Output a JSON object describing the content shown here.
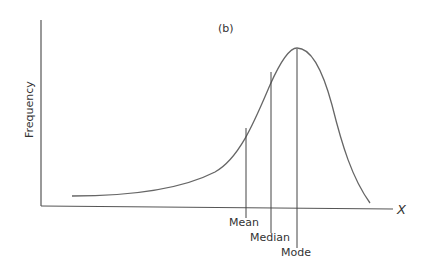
{
  "figure": {
    "panel_label": "(b)",
    "y_axis_label": "Frequency",
    "x_axis_label": "X",
    "markers": [
      {
        "label": "Mean",
        "x": 246,
        "top_y": 128,
        "label_y": 227
      },
      {
        "label": "Median",
        "x": 271,
        "top_y": 72,
        "label_y": 243
      },
      {
        "label": "Mode",
        "x": 297,
        "top_y": 49,
        "label_y": 258
      }
    ],
    "curve_description": "Negatively (left) skewed distribution",
    "colors": {
      "line": "#555555",
      "text": "#333333"
    }
  }
}
